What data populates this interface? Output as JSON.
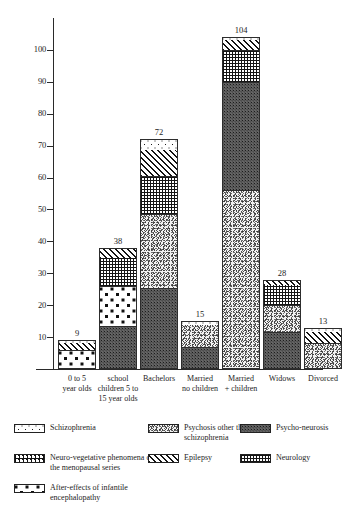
{
  "chart_data": {
    "type": "bar",
    "subtype": "stacked-bar",
    "title": "",
    "xlabel": "",
    "ylabel": "",
    "ylim": [
      0,
      110
    ],
    "y_ticks": [
      10,
      20,
      30,
      40,
      50,
      60,
      70,
      80,
      90,
      100
    ],
    "grid": false,
    "legend_position": "bottom",
    "categories": [
      "0 to 5 year olds",
      "school children 5 to 15 year olds",
      "Bachelors",
      "Married no children",
      "Married + children",
      "Widows",
      "Divorced"
    ],
    "category_lines": [
      [
        "0 to 5",
        "year olds"
      ],
      [
        "school",
        "children 5 to",
        "15 year olds"
      ],
      [
        "Bachelors"
      ],
      [
        "Married",
        "no children"
      ],
      [
        "Married",
        "+ children"
      ],
      [
        "Widows"
      ],
      [
        "Divorced"
      ]
    ],
    "totals": [
      9,
      38,
      72,
      15,
      104,
      28,
      13
    ],
    "series": [
      {
        "name": "Schizophrenia",
        "key": "schizophrenia",
        "values": [
          0.5,
          0,
          3,
          1,
          0.5,
          0,
          1
        ]
      },
      {
        "name": "Psychosis other than schizophrenia",
        "key": "psychosis-other",
        "values": [
          0,
          0,
          23,
          7,
          56,
          8.5,
          8
        ]
      },
      {
        "name": "Psycho-neurosis",
        "key": "psycho-neurosis",
        "values": [
          0,
          13.5,
          25.5,
          7,
          34,
          11.5,
          0
        ]
      },
      {
        "name": "Neuro-vegetative phenomena of the menopausal series",
        "key": "neurovegetative",
        "values": [
          6,
          12.5,
          0,
          0,
          0,
          0,
          0
        ]
      },
      {
        "name": "Epilepsy",
        "key": "epilepsy",
        "values": [
          2.5,
          3,
          8.5,
          0,
          3.5,
          1.5,
          4
        ]
      },
      {
        "name": "Neurology",
        "key": "neurology",
        "values": [
          0,
          9,
          12,
          0,
          10,
          6.5,
          0
        ]
      }
    ],
    "stack_order_bottom_to_top": [
      [
        "neurovegetative",
        "epilepsy",
        "schizophrenia"
      ],
      [
        "psycho-neurosis",
        "neurovegetative",
        "neurology",
        "epilepsy"
      ],
      [
        "psycho-neurosis",
        "psychosis-other",
        "neurology",
        "epilepsy",
        "schizophrenia"
      ],
      [
        "psycho-neurosis",
        "psychosis-other",
        "schizophrenia"
      ],
      [
        "psychosis-other",
        "psycho-neurosis",
        "neurology",
        "epilepsy",
        "schizophrenia"
      ],
      [
        "psycho-neurosis",
        "psychosis-other",
        "neurology",
        "epilepsy"
      ],
      [
        "psychosis-other",
        "epilepsy",
        "schizophrenia"
      ]
    ],
    "bars": [
      {
        "category": "0 to 5 year olds",
        "total": 9,
        "segments": [
          {
            "name": "After-effects of infantile encephalopathy",
            "key": "encephalopathy",
            "value": 6
          },
          {
            "name": "Epilepsy",
            "key": "epilepsy",
            "value": 2.5
          },
          {
            "name": "Schizophrenia",
            "key": "schizophrenia",
            "value": 0.5
          }
        ]
      },
      {
        "category": "school children 5 to 15 year olds",
        "total": 38,
        "segments": [
          {
            "name": "Psycho-neurosis",
            "key": "psycho-neurosis",
            "value": 13.5
          },
          {
            "name": "After-effects of infantile encephalopathy",
            "key": "encephalopathy",
            "value": 12.5
          },
          {
            "name": "Neurology",
            "key": "neurology",
            "value": 9
          },
          {
            "name": "Epilepsy",
            "key": "epilepsy",
            "value": 3
          }
        ]
      },
      {
        "category": "Bachelors",
        "total": 72,
        "segments": [
          {
            "name": "Psycho-neurosis",
            "key": "psycho-neurosis",
            "value": 25.5
          },
          {
            "name": "Psychosis other than schizophrenia",
            "key": "psychosis-other",
            "value": 23
          },
          {
            "name": "Neurology",
            "key": "neurology",
            "value": 12
          },
          {
            "name": "Epilepsy",
            "key": "epilepsy",
            "value": 8.5
          },
          {
            "name": "Schizophrenia",
            "key": "schizophrenia",
            "value": 3
          }
        ]
      },
      {
        "category": "Married no children",
        "total": 15,
        "segments": [
          {
            "name": "Psycho-neurosis",
            "key": "psycho-neurosis",
            "value": 7
          },
          {
            "name": "Psychosis other than schizophrenia",
            "key": "psychosis-other",
            "value": 7
          },
          {
            "name": "Schizophrenia",
            "key": "schizophrenia",
            "value": 1
          }
        ]
      },
      {
        "category": "Married + children",
        "total": 104,
        "segments": [
          {
            "name": "Psychosis other than schizophrenia",
            "key": "psychosis-other",
            "value": 56
          },
          {
            "name": "Psycho-neurosis",
            "key": "psycho-neurosis",
            "value": 34
          },
          {
            "name": "Neurology",
            "key": "neurology",
            "value": 10
          },
          {
            "name": "Epilepsy",
            "key": "epilepsy",
            "value": 3.5
          },
          {
            "name": "Schizophrenia",
            "key": "schizophrenia",
            "value": 0.5
          }
        ]
      },
      {
        "category": "Widows",
        "total": 28,
        "segments": [
          {
            "name": "Psycho-neurosis",
            "key": "psycho-neurosis",
            "value": 11.5
          },
          {
            "name": "Psychosis other than schizophrenia",
            "key": "psychosis-other",
            "value": 8.5
          },
          {
            "name": "Neurology",
            "key": "neurology",
            "value": 6.5
          },
          {
            "name": "Epilepsy",
            "key": "epilepsy",
            "value": 1.5
          }
        ]
      },
      {
        "category": "Divorced",
        "total": 13,
        "segments": [
          {
            "name": "Psychosis other than schizophrenia",
            "key": "psychosis-other",
            "value": 8
          },
          {
            "name": "Epilepsy",
            "key": "epilepsy",
            "value": 4
          },
          {
            "name": "Schizophrenia",
            "key": "schizophrenia",
            "value": 1
          }
        ]
      }
    ],
    "legend": [
      {
        "key": "schizophrenia",
        "label": "Schizophrenia",
        "col": 0,
        "row": 0
      },
      {
        "key": "psychosis-other",
        "label": "Psychosis other than schizophrenia",
        "col": 1,
        "row": 0
      },
      {
        "key": "psycho-neurosis",
        "label": "Psycho-neurosis",
        "col": 2,
        "row": 0
      },
      {
        "key": "neurovegetative",
        "label": "Neuro-vegetative phenomena of the menopausal series",
        "col": 0,
        "row": 1
      },
      {
        "key": "epilepsy",
        "label": "Epilepsy",
        "col": 1,
        "row": 1
      },
      {
        "key": "neurology",
        "label": "Neurology",
        "col": 2,
        "row": 1
      },
      {
        "key": "encephalopathy",
        "label": "After-effects of infantile encephalopathy",
        "col": 0,
        "row": 2
      }
    ]
  }
}
